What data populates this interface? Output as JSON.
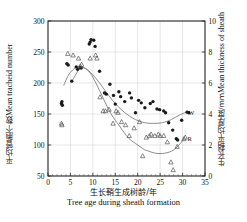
{
  "chart_data": {
    "type": "scatter",
    "title": "",
    "xlabel_cn": "生长鞘生成树龄/年",
    "xlabel_en": "Tree age during sheath formation",
    "ylabel_left_cn": "平均管胞个数",
    "ylabel_left_en": "Mean tracheid number",
    "ylabel_right_cn": "生长鞘平均厚度/mm",
    "ylabel_right_en": "Mean thickness of sheath",
    "xlim": [
      0,
      35
    ],
    "ylim_left": [
      50,
      300
    ],
    "ylim_right": [
      0,
      10
    ],
    "xticks": [
      0,
      5,
      10,
      15,
      20,
      25,
      30,
      35
    ],
    "yticks_left": [
      50,
      100,
      150,
      200,
      250,
      300
    ],
    "yticks_right": [
      0,
      2,
      4,
      6,
      8,
      10
    ],
    "grid": true,
    "legend_position": "inline-right-of-curves",
    "series": [
      {
        "name": "Mean tracheid number",
        "label": "W",
        "axis": "left",
        "marker": "filled-circle",
        "color": "#1a1a1a",
        "points": [
          [
            3.0,
            167
          ],
          [
            3.1,
            170
          ],
          [
            3.2,
            164
          ],
          [
            4.2,
            231
          ],
          [
            4.5,
            229
          ],
          [
            5.3,
            203
          ],
          [
            6.3,
            226
          ],
          [
            6.6,
            222
          ],
          [
            7.2,
            225
          ],
          [
            7.4,
            224
          ],
          [
            9.2,
            263
          ],
          [
            9.4,
            266
          ],
          [
            9.6,
            270
          ],
          [
            10.2,
            269
          ],
          [
            10.5,
            259
          ],
          [
            11.5,
            219
          ],
          [
            12.6,
            184
          ],
          [
            13.0,
            182
          ],
          [
            13.8,
            198
          ],
          [
            14.6,
            180
          ],
          [
            15.0,
            166
          ],
          [
            15.8,
            186
          ],
          [
            16.2,
            178
          ],
          [
            17.1,
            170
          ],
          [
            18.2,
            184
          ],
          [
            18.6,
            176
          ],
          [
            19.5,
            152
          ],
          [
            20.2,
            172
          ],
          [
            20.8,
            168
          ],
          [
            21.6,
            160
          ],
          [
            22.8,
            167
          ],
          [
            23.4,
            170
          ],
          [
            24.3,
            158
          ],
          [
            24.9,
            157
          ],
          [
            25.8,
            155
          ],
          [
            26.2,
            152
          ],
          [
            26.9,
            136
          ],
          [
            27.8,
            124
          ],
          [
            28.6,
            110
          ],
          [
            28.9,
            108
          ],
          [
            29.8,
            140
          ],
          [
            31.0,
            153
          ],
          [
            31.4,
            152
          ]
        ]
      },
      {
        "name": "Mean thickness of sheath",
        "label": "R",
        "axis": "right",
        "marker": "open-triangle",
        "color": "#555555",
        "points": [
          [
            3.0,
            3.4
          ],
          [
            3.1,
            3.3
          ],
          [
            4.4,
            7.9
          ],
          [
            5.6,
            7.8
          ],
          [
            6.8,
            7.6
          ],
          [
            7.2,
            7.1
          ],
          [
            7.5,
            7.2
          ],
          [
            9.4,
            7.6
          ],
          [
            10.6,
            7.8
          ],
          [
            10.9,
            7.6
          ],
          [
            11.6,
            5.1
          ],
          [
            12.3,
            4.2
          ],
          [
            12.8,
            4.2
          ],
          [
            13.6,
            4.3
          ],
          [
            14.5,
            3.4
          ],
          [
            15.2,
            4.2
          ],
          [
            15.6,
            4.1
          ],
          [
            16.4,
            3.5
          ],
          [
            17.3,
            3.3
          ],
          [
            18.1,
            2.6
          ],
          [
            19.2,
            3.1
          ],
          [
            20.4,
            3.5
          ],
          [
            21.1,
            1.3
          ],
          [
            21.9,
            2.5
          ],
          [
            22.6,
            2.6
          ],
          [
            23.0,
            2.7
          ],
          [
            23.8,
            2.6
          ],
          [
            24.6,
            2.7
          ],
          [
            25.0,
            2.6
          ],
          [
            25.8,
            2.6
          ],
          [
            26.6,
            2.2
          ],
          [
            27.4,
            0.9
          ],
          [
            27.9,
            0.4
          ],
          [
            28.8,
            1.9
          ],
          [
            30.3,
            2.4
          ],
          [
            30.6,
            2.5
          ]
        ]
      }
    ],
    "fitted_curves": [
      {
        "name": "tracheid-fit-curve",
        "axis": "left",
        "color": "#777777",
        "points": [
          [
            3.5,
            196
          ],
          [
            4.5,
            212
          ],
          [
            5.5,
            221
          ],
          [
            6.5,
            226
          ],
          [
            7.5,
            226
          ],
          [
            8.5,
            223
          ],
          [
            9.5,
            217
          ],
          [
            10.5,
            209
          ],
          [
            11.5,
            200
          ],
          [
            12.5,
            190
          ],
          [
            13.5,
            180
          ],
          [
            14.5,
            171
          ],
          [
            15.5,
            163
          ],
          [
            16.5,
            156
          ],
          [
            17.5,
            150
          ],
          [
            18.5,
            145
          ],
          [
            19.5,
            141
          ],
          [
            20.5,
            138
          ],
          [
            21.5,
            136
          ],
          [
            22.5,
            135
          ],
          [
            23.5,
            135
          ],
          [
            24.5,
            135
          ],
          [
            25.5,
            136
          ],
          [
            26.5,
            138
          ],
          [
            27.5,
            141
          ],
          [
            28.5,
            145
          ],
          [
            29.5,
            149
          ],
          [
            30.5,
            152
          ]
        ]
      },
      {
        "name": "sheath-fit-curve",
        "axis": "right",
        "color": "#777777",
        "points": [
          [
            5.5,
            6.2
          ],
          [
            6.5,
            6.7
          ],
          [
            7.0,
            6.9
          ],
          [
            7.5,
            7.0
          ],
          [
            8.5,
            6.9
          ],
          [
            9.5,
            6.6
          ],
          [
            10.5,
            6.1
          ],
          [
            11.5,
            5.5
          ],
          [
            12.5,
            4.9
          ],
          [
            13.5,
            4.3
          ],
          [
            14.5,
            3.8
          ],
          [
            15.5,
            3.4
          ],
          [
            16.5,
            3.0
          ],
          [
            17.5,
            2.6
          ],
          [
            18.5,
            2.3
          ],
          [
            19.5,
            2.1
          ],
          [
            20.5,
            1.9
          ],
          [
            21.5,
            1.7
          ],
          [
            22.5,
            1.6
          ],
          [
            23.5,
            1.5
          ],
          [
            24.5,
            1.45
          ],
          [
            25.5,
            1.45
          ],
          [
            26.5,
            1.5
          ],
          [
            27.5,
            1.6
          ],
          [
            28.5,
            1.8
          ],
          [
            29.5,
            2.1
          ],
          [
            30.3,
            2.4
          ]
        ]
      }
    ]
  }
}
